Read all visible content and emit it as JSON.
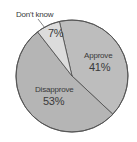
{
  "chart_data": {
    "type": "pie",
    "title": "",
    "categories": [
      "Approve",
      "Disapprove",
      "Don't know"
    ],
    "values": [
      41,
      53,
      7
    ],
    "labels": [
      "41%",
      "53%",
      "7%"
    ],
    "start_angle_deg": -13,
    "direction": "clockwise",
    "colors": [
      "#bdbdbd",
      "#b5b5b5",
      "#dcdcdc"
    ],
    "legend": "none",
    "annotations": [
      {
        "text": "Don't know",
        "type": "callout",
        "target": "Don't know"
      }
    ]
  },
  "labels": {
    "approve": {
      "name": "Approve",
      "pct": "41%"
    },
    "disapprove": {
      "name": "Disapprove",
      "pct": "53%"
    },
    "dontknow": {
      "name": "Don't know",
      "pct": "7%"
    }
  }
}
